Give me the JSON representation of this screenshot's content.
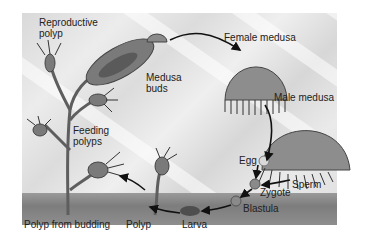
{
  "diagram": {
    "type": "life-cycle",
    "labels": {
      "reproductive_polyp": "Reproductive\npolyp",
      "reproductive_polyp_l1": "Reproductive",
      "reproductive_polyp_l2": "polyp",
      "medusa_buds_l1": "Medusa",
      "medusa_buds_l2": "buds",
      "female_medusa": "Female medusa",
      "male_medusa": "Male medusa",
      "feeding_polyps_l1": "Feeding",
      "feeding_polyps_l2": "polyps",
      "egg": "Egg",
      "sperm": "Sperm",
      "zygote": "Zygote",
      "blastula": "Blastula",
      "larva": "Larva",
      "polyp": "Polyp",
      "polyp_from_budding": "Polyp from budding"
    },
    "sequence": [
      "Reproductive polyp",
      "Medusa buds",
      "Female medusa",
      "Male medusa",
      "Egg",
      "Sperm",
      "Zygote",
      "Blastula",
      "Larva",
      "Polyp",
      "Polyp from budding"
    ],
    "colors": {
      "background": "#e3e3e3",
      "ground": "#858585",
      "organism": "#6e6e6e",
      "arrow": "#111111"
    }
  }
}
